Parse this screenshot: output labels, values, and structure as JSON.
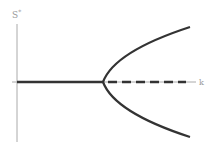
{
  "diagram": {
    "type": "bifurcation-diagram",
    "y_axis_label": "S",
    "y_axis_label_superscript": "*",
    "x_axis_label": "k",
    "colors": {
      "axis": "#aaaaaa",
      "curve": "#333333",
      "label": "#9a9a9a"
    },
    "branches": [
      {
        "name": "stable-trivial",
        "style": "solid",
        "description": "S*=0 for k < k_c"
      },
      {
        "name": "unstable-trivial",
        "style": "dashed",
        "description": "S*=0 for k > k_c"
      },
      {
        "name": "upper-branch",
        "style": "solid"
      },
      {
        "name": "lower-branch",
        "style": "solid"
      }
    ]
  }
}
